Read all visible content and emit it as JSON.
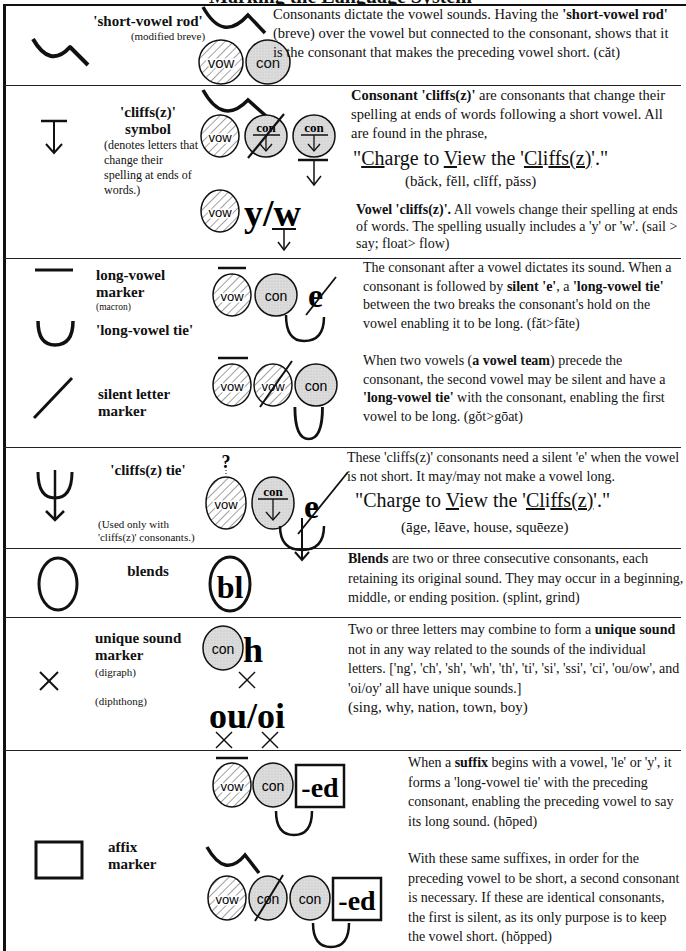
{
  "title_strip": "Marking the Language System",
  "rows": [
    {
      "symbol_icon": "short-vowel-rod-icon",
      "label": "'short-vowel rod'",
      "sublabel": "(modified breve)",
      "diagram": {
        "circles": [
          "vow",
          "con"
        ]
      },
      "desc": [
        {
          "t": "Consonants dictate the vowel sounds.  Having the ",
          "b": false
        },
        {
          "t": "'short-vowel rod'",
          "b": true
        },
        {
          "t": " (breve) over the vowel but connected to the consonant, shows that it is the consonant that makes the preceding vowel short.  (căt)",
          "b": false
        }
      ]
    },
    {
      "symbol_icon": "cliffs-symbol-icon",
      "label_line1": "'cliffs(z)'",
      "label_line2": "symbol",
      "sublabel": "(denotes letters that change their spelling at ends of words.)",
      "diagram": {
        "circles": [
          "vow",
          "con",
          "con"
        ],
        "yw": "y/w"
      },
      "desc_intro_bold": "Consonant 'cliffs(z)'",
      "desc_intro": " are consonants that change their spelling at ends of words following a short vowel.  All are found in the phrase,",
      "phrase": {
        "q1": "\"",
        "ch": "Ch",
        "arge": "arge to ",
        "v": "V",
        "iew": "iew the '",
        "cl": "Cl",
        "i": "i",
        "ffsz": "ffs(z)",
        "end": "'.\""
      },
      "examples": "(băck, fĕll, clĭff, păss)",
      "vowel_bold": "Vowel 'cliffs(z)'.",
      "vowel_text": "  All vowels change their spelling at ends of words.  The spelling usually includes a 'y' or 'w'.  (sail > say; float> flow)"
    },
    {
      "symbol_icon": "long-vowel-marker-icon",
      "label": "long-vowel marker",
      "sublabel": "(macron)",
      "label2": "'long-vowel tie'",
      "tie_icon": "long-vowel-tie-icon",
      "diagram": {
        "circles": [
          "vow",
          "con"
        ],
        "e": "e"
      },
      "desc_parts": [
        {
          "t": "The consonant after a vowel dictates its sound. When a consonant is followed by ",
          "b": false
        },
        {
          "t": "silent 'e'",
          "b": true
        },
        {
          "t": ", a ",
          "b": false
        },
        {
          "t": "'long-vowel tie'",
          "b": true
        },
        {
          "t": " between the two breaks the consonant's hold on the vowel enabling it to be long.   (făt>fāte)",
          "b": false
        }
      ]
    },
    {
      "symbol_icon": "silent-letter-marker-icon",
      "label": "silent letter marker",
      "diagram": {
        "circles": [
          "vow",
          "vow",
          "con"
        ]
      },
      "desc_parts": [
        {
          "t": "When two vowels (",
          "b": false
        },
        {
          "t": "a vowel team",
          "b": true
        },
        {
          "t": ") precede the consonant, the second vowel may be silent and have a ",
          "b": false
        },
        {
          "t": "'long-vowel tie'",
          "b": true
        },
        {
          "t": " with the consonant, enabling the first vowel to be long.  (gŏt>gōat)",
          "b": false
        }
      ]
    },
    {
      "symbol_icon": "cliffs-tie-icon",
      "label": "'cliffs(z) tie'",
      "sublabel": "(Used only with 'cliffs(z)' consonants.)",
      "diagram": {
        "question": "?",
        "circles": [
          "vow",
          "con"
        ],
        "e": "e"
      },
      "desc": "These 'cliffs(z)' consonants need a silent 'e' when the vowel is not short. It may/may not make a vowel long.",
      "phrase": {
        "q1": "\"Charge to ",
        "v": "V",
        "iew": "iew the '",
        "cl": "Cl",
        "i": "i",
        "ffsz": "ffs(z)",
        "end": "'.\""
      },
      "examples": "(āge, lēave, house, squēeze)"
    },
    {
      "symbol_icon": "blend-oval-icon",
      "label": "blends",
      "diagram": {
        "text": "bl"
      },
      "desc_parts": [
        {
          "t": "Blends",
          "b": true
        },
        {
          "t": " are two or three consecutive consonants, each retaining its original sound.  They may occur in a beginning, middle, or ending position.  (splint, grind)",
          "b": false
        }
      ]
    },
    {
      "symbol_icon": "unique-sound-x-icon",
      "label": "unique sound marker",
      "sublabel_digraph": "(digraph)",
      "sublabel_diphthong": "(diphthong)",
      "diagram": {
        "circle": "con",
        "h": "h",
        "ouoi": "ou/oi"
      },
      "desc_parts": [
        {
          "t": "Two or three letters may combine to form a ",
          "b": false
        },
        {
          "t": "unique sound",
          "b": true
        },
        {
          "t": " not in any way related to the sounds of the individual letters. ['ng', 'ch', 'sh', 'wh', 'th', 'ti', 'si', 'ssi', 'ci', 'ou/ow', and 'oi/oy' all have unique sounds.]",
          "b": false
        }
      ],
      "examples": "(sing, why, nation, town, boy)"
    },
    {
      "symbol_icon": "affix-box-icon",
      "label": "affix marker",
      "diagram": {
        "top": [
          "vow",
          "con"
        ],
        "bottom": [
          "vow",
          "con",
          "con"
        ],
        "suffix": "-ed"
      },
      "desc1_parts": [
        {
          "t": "When a ",
          "b": false
        },
        {
          "t": "suffix",
          "b": true
        },
        {
          "t": " begins with a vowel, 'le' or 'y', it forms a 'long-vowel tie' with the preceding consonant, enabling the preceding vowel to say its long sound.  (hōped)",
          "b": false
        }
      ],
      "desc2": "With these same suffixes, in order for the preceding vowel to be short, a second consonant is necessary.  If these are identical consonants, the first is silent, as its only purpose is to keep the vowel short.  (hŏpped)"
    }
  ],
  "colors": {
    "ink": "#111111",
    "consonant_fill": "#d9d9d9",
    "hatch": "#444444"
  }
}
